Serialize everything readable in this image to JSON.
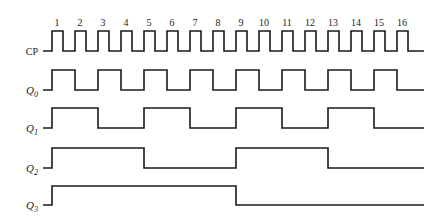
{
  "diagram": {
    "type": "timing-diagram",
    "signals": [
      {
        "name": "CP",
        "label_main": "CP",
        "label_sub": "",
        "period_pulses": 1
      },
      {
        "name": "Q0",
        "label_main": "Q",
        "label_sub": "0",
        "period_pulses": 2
      },
      {
        "name": "Q1",
        "label_main": "Q",
        "label_sub": "1",
        "period_pulses": 4
      },
      {
        "name": "Q2",
        "label_main": "Q",
        "label_sub": "2",
        "period_pulses": 8
      },
      {
        "name": "Q3",
        "label_main": "Q",
        "label_sub": "3",
        "period_pulses": 16
      }
    ],
    "pulse_numbers": [
      "1",
      "2",
      "3",
      "4",
      "5",
      "6",
      "7",
      "8",
      "9",
      "10",
      "11",
      "12",
      "13",
      "14",
      "15",
      "16"
    ],
    "line_color": "#1a1a1a"
  }
}
